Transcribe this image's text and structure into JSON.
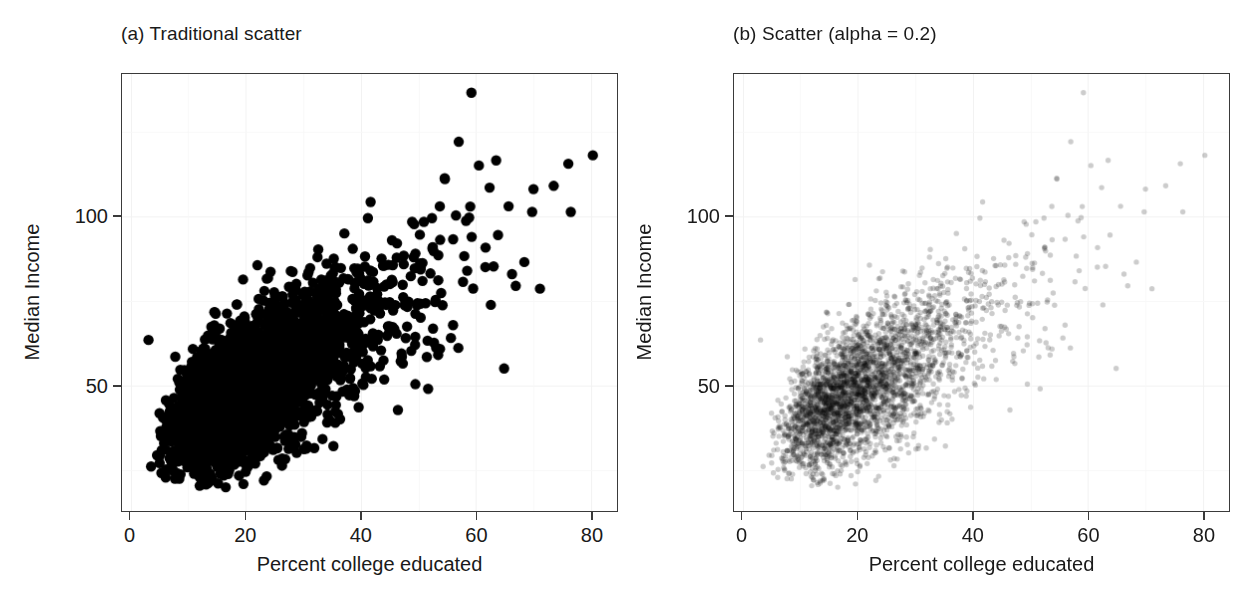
{
  "figure": {
    "background": "#ffffff",
    "frame_color": "#3a3a3a",
    "grid_color": "#f2f2f2"
  },
  "chart_data": [
    {
      "id": "panel-a",
      "type": "scatter",
      "title": "(a) Traditional scatter",
      "xlabel": "Percent college educated",
      "ylabel": "Median Income",
      "xlim": [
        -1.5,
        84.5
      ],
      "ylim": [
        13.0,
        142.0
      ],
      "xticks": [
        0,
        20,
        40,
        60,
        80
      ],
      "xticklabels": [
        "0",
        "20",
        "40",
        "60",
        "80"
      ],
      "yticks": [
        50,
        100
      ],
      "yticklabels": [
        "50",
        "100"
      ],
      "grid": true,
      "point_color": "#000000",
      "point_alpha": 1.0,
      "point_radius": 5.2,
      "n_points": 3100,
      "seed": 20240417,
      "generator": {
        "x_lognormal_mu": 3.02,
        "x_lognormal_sigma": 0.44,
        "x_min": 2.5,
        "x_max": 81.0,
        "y_intercept": 29.5,
        "y_slope": 0.96,
        "y_noise_base": 7.4,
        "y_noise_slope": 0.13,
        "y_min": 20.0,
        "y_max": 138.0,
        "outliers": [
          {
            "x": 59.2,
            "y": 136.5
          },
          {
            "x": 80.3,
            "y": 118.0
          },
          {
            "x": 73.5,
            "y": 109.0
          },
          {
            "x": 63.5,
            "y": 116.5
          },
          {
            "x": 3.1,
            "y": 63.5
          },
          {
            "x": 60.5,
            "y": 115.0
          },
          {
            "x": 57.0,
            "y": 122.0
          },
          {
            "x": 54.6,
            "y": 111.0
          },
          {
            "x": 58.8,
            "y": 99.6
          }
        ]
      }
    },
    {
      "id": "panel-b",
      "type": "scatter",
      "title": "(b) Scatter (alpha = 0.2)",
      "xlabel": "Percent college educated",
      "ylabel": "Median Income",
      "xlim": [
        -1.5,
        84.5
      ],
      "ylim": [
        13.0,
        142.0
      ],
      "xticks": [
        0,
        20,
        40,
        60,
        80
      ],
      "xticklabels": [
        "0",
        "20",
        "40",
        "60",
        "80"
      ],
      "yticks": [
        50,
        100
      ],
      "yticklabels": [
        "50",
        "100"
      ],
      "grid": true,
      "point_color": "#000000",
      "point_alpha": 0.2,
      "point_radius": 2.7,
      "n_points": 3100,
      "seed": 20240417,
      "generator": {
        "x_lognormal_mu": 3.02,
        "x_lognormal_sigma": 0.44,
        "x_min": 2.5,
        "x_max": 81.0,
        "y_intercept": 29.5,
        "y_slope": 0.96,
        "y_noise_base": 7.4,
        "y_noise_slope": 0.13,
        "y_min": 20.0,
        "y_max": 138.0,
        "outliers": [
          {
            "x": 59.2,
            "y": 136.5
          },
          {
            "x": 80.3,
            "y": 118.0
          },
          {
            "x": 73.5,
            "y": 109.0
          },
          {
            "x": 63.5,
            "y": 116.5
          },
          {
            "x": 3.1,
            "y": 63.5
          },
          {
            "x": 60.5,
            "y": 115.0
          },
          {
            "x": 57.0,
            "y": 122.0
          },
          {
            "x": 54.6,
            "y": 111.0
          },
          {
            "x": 58.8,
            "y": 99.6
          }
        ]
      }
    }
  ]
}
